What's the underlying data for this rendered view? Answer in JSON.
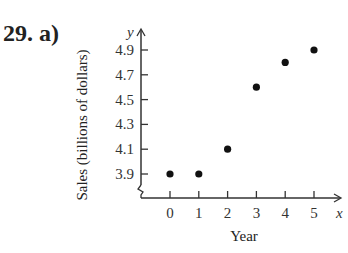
{
  "problem": {
    "label": "29.  a)"
  },
  "chart_data": {
    "type": "scatter",
    "title": "",
    "xlabel": "Year",
    "ylabel": "Sales (billions of dollars)",
    "x_axis_letter": "x",
    "y_axis_letter": "y",
    "x": [
      0,
      1,
      2,
      3,
      4,
      5
    ],
    "y": [
      3.9,
      3.9,
      4.1,
      4.6,
      4.8,
      4.9
    ],
    "x_ticks": [
      "0",
      "1",
      "2",
      "3",
      "4",
      "5"
    ],
    "y_ticks": [
      "3.9",
      "4.1",
      "4.3",
      "4.5",
      "4.7",
      "4.9"
    ],
    "xlim": [
      -0.9,
      5.8
    ],
    "ylim": [
      3.7,
      5.0
    ],
    "y_axis_break": true,
    "grid": false,
    "marker_color": "#111111"
  }
}
